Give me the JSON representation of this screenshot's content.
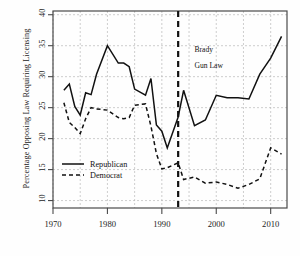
{
  "chart_data": {
    "type": "line",
    "title": "",
    "xlabel": "",
    "ylabel": "Percentage Opposing Law Requiring Licensing",
    "xlim": [
      1970,
      2013
    ],
    "ylim": [
      8.8,
      40.6
    ],
    "xticks": [
      1970,
      1980,
      1990,
      2000,
      2010
    ],
    "yticks": [
      10,
      15,
      20,
      25,
      30,
      35,
      40
    ],
    "grid": true,
    "legend_position": "lower-left-inside",
    "series": [
      {
        "name": "Republican",
        "style": "solid",
        "color": "#111111",
        "x": [
          1972,
          1973,
          1974,
          1975,
          1976,
          1977,
          1978,
          1980,
          1982,
          1983,
          1984,
          1985,
          1987,
          1988,
          1989,
          1990,
          1991,
          1993,
          1994,
          1996,
          1998,
          2000,
          2002,
          2004,
          2006,
          2008,
          2010,
          2012
        ],
        "values": [
          27.8,
          28.8,
          25.2,
          23.8,
          27.4,
          27.1,
          30.4,
          35.0,
          32.2,
          32.2,
          31.6,
          28.0,
          27.0,
          29.7,
          22.2,
          21.2,
          18.5,
          23.5,
          27.8,
          22.1,
          23.0,
          27.0,
          26.6,
          26.6,
          26.4,
          30.4,
          33.0,
          36.5
        ]
      },
      {
        "name": "Democrat",
        "style": "dashed",
        "color": "#111111",
        "x": [
          1972,
          1973,
          1974,
          1975,
          1976,
          1977,
          1978,
          1980,
          1982,
          1983,
          1984,
          1985,
          1987,
          1988,
          1989,
          1990,
          1991,
          1993,
          1994,
          1996,
          1998,
          2000,
          2002,
          2004,
          2006,
          2008,
          2010,
          2012
        ],
        "values": [
          25.8,
          22.6,
          21.8,
          20.8,
          23.2,
          25.0,
          24.8,
          24.6,
          23.4,
          23.2,
          23.4,
          25.4,
          25.6,
          22.0,
          17.6,
          15.1,
          15.3,
          16.1,
          13.4,
          13.8,
          12.8,
          13.0,
          12.6,
          12.0,
          12.6,
          13.5,
          18.5,
          17.5
        ]
      }
    ],
    "annotations": [
      {
        "name": "brady-gun-law-marker",
        "type": "vline",
        "x": 1993,
        "style": "dashed",
        "label_line1": "Brady",
        "label_line2": "Gun Law",
        "label_x": 1996,
        "label_y1": 34.0,
        "label_y2": 31.4
      }
    ]
  },
  "legend": {
    "items": [
      {
        "label": "Republican",
        "style": "solid"
      },
      {
        "label": "Democrat",
        "style": "dashed"
      }
    ]
  }
}
